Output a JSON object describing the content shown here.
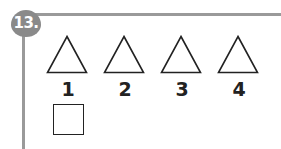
{
  "question": {
    "number": "13.",
    "shapes": [
      {
        "shape": "triangle",
        "label": "1"
      },
      {
        "shape": "triangle",
        "label": "2"
      },
      {
        "shape": "triangle",
        "label": "3"
      },
      {
        "shape": "triangle",
        "label": "4"
      }
    ],
    "answer_box": ""
  },
  "colors": {
    "frame": "#9a9a9a",
    "badge": "#8a8a8a",
    "ink": "#222222"
  }
}
